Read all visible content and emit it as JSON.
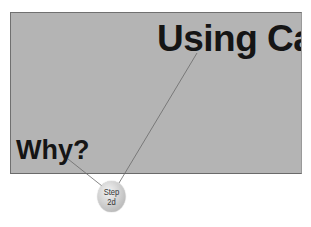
{
  "slide": {
    "title": "Using Ca",
    "subtitle": "Why?",
    "background_color": "#b4b4b4"
  },
  "callout": {
    "line1": "Step",
    "line2": "2d",
    "targets": [
      "title",
      "subtitle"
    ]
  }
}
